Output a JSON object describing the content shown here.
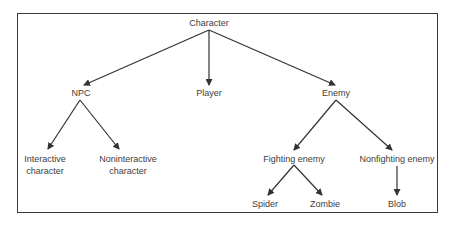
{
  "diagram": {
    "type": "tree",
    "colors": {
      "line": "#333333",
      "text": "#404040",
      "border": "#3a3a3a"
    },
    "nodes": {
      "character": {
        "label": "Character"
      },
      "npc": {
        "label": "NPC"
      },
      "player": {
        "label": "Player"
      },
      "enemy": {
        "label": "Enemy"
      },
      "interactive": {
        "line1": "Interactive",
        "line2": "character"
      },
      "noninteractive": {
        "line1": "Noninteractive",
        "line2": "character"
      },
      "fighting": {
        "label": "Fighting enemy"
      },
      "nonfighting": {
        "label": "Nonfighting enemy"
      },
      "spider": {
        "label": "Spider"
      },
      "zombie": {
        "label": "Zombie"
      },
      "blob": {
        "label": "Blob"
      }
    },
    "edges": [
      [
        "Character",
        "NPC"
      ],
      [
        "Character",
        "Player"
      ],
      [
        "Character",
        "Enemy"
      ],
      [
        "NPC",
        "Interactive character"
      ],
      [
        "NPC",
        "Noninteractive character"
      ],
      [
        "Enemy",
        "Fighting enemy"
      ],
      [
        "Enemy",
        "Nonfighting enemy"
      ],
      [
        "Fighting enemy",
        "Spider"
      ],
      [
        "Fighting enemy",
        "Zombie"
      ],
      [
        "Nonfighting enemy",
        "Blob"
      ]
    ]
  }
}
